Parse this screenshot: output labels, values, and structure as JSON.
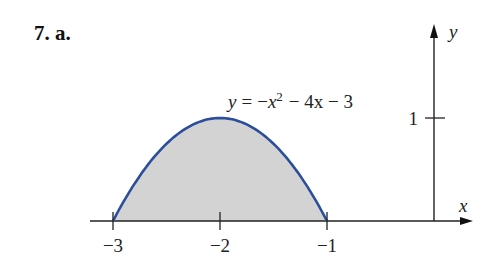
{
  "problem_label": "7. a.",
  "chart_data": {
    "type": "area",
    "title": "",
    "function": "y = -x^2 - 4x - 3",
    "equation_label": {
      "y": "y",
      "eq": "=",
      "neg": "−",
      "x": "x",
      "sup": "2",
      "rest": "− 4x − 3"
    },
    "xlabel": "x",
    "ylabel": "y",
    "xlim": [
      -3.3,
      0.35
    ],
    "ylim": [
      0,
      1.9
    ],
    "x_ticks": [
      -3,
      -2,
      -1
    ],
    "x_tick_labels": [
      "−3",
      "−2",
      "−1"
    ],
    "y_ticks": [
      1
    ],
    "y_tick_labels": [
      "1"
    ],
    "shaded_interval": [
      -3,
      -1
    ],
    "curve_points": [
      {
        "x": -3,
        "y": 0
      },
      {
        "x": -2.5,
        "y": 0.75
      },
      {
        "x": -2,
        "y": 1
      },
      {
        "x": -1.5,
        "y": 0.75
      },
      {
        "x": -1,
        "y": 0
      }
    ],
    "grid": false,
    "colors": {
      "curve": "#2b4e9c",
      "fill": "#d3d3d3",
      "axis": "#222222"
    }
  }
}
